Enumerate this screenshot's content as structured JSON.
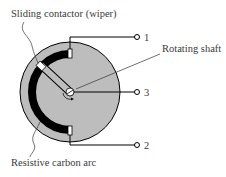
{
  "diagram": {
    "labels": {
      "wiper": "Sliding contactor (wiper)",
      "shaft": "Rotating shaft",
      "arc": "Resistive carbon arc"
    },
    "terminals": [
      {
        "id": "terminal-1",
        "label": "1"
      },
      {
        "id": "terminal-3",
        "label": "3"
      },
      {
        "id": "terminal-2",
        "label": "2"
      }
    ],
    "colors": {
      "body": "#bdbdbd",
      "arc": "#000000",
      "line": "#000000",
      "text": "#3a3a3a"
    }
  }
}
